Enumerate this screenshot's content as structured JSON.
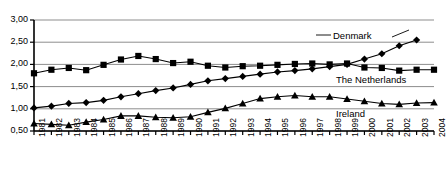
{
  "chart_data": {
    "type": "line",
    "title": "",
    "xlabel": "",
    "ylabel": "",
    "ylim": [
      0.5,
      3.0
    ],
    "yticks": [
      0.5,
      1.0,
      1.5,
      2.0,
      2.5,
      3.0
    ],
    "ytick_labels": [
      "0,50",
      "1,00",
      "1,50",
      "2,00",
      "2,50",
      "3,00"
    ],
    "grid": true,
    "legend": "inline-labels",
    "decimal_separator": ",",
    "x": [
      1981,
      1982,
      1983,
      1984,
      1985,
      1986,
      1987,
      1988,
      1989,
      1990,
      1991,
      1992,
      1993,
      1994,
      1995,
      1996,
      1997,
      1998,
      1999,
      2000,
      2001,
      2002,
      2003,
      2004
    ],
    "xtick_labels": [
      "1981",
      "1982",
      "1983",
      "1984",
      "1985",
      "1986",
      "1987",
      "1988",
      "1989",
      "1990",
      "1991",
      "1992",
      "1993",
      "1994",
      "1995",
      "1996",
      "1997",
      "1998",
      "1999",
      "2000",
      "2001",
      "2002",
      "2003",
      "2004"
    ],
    "series": [
      {
        "name": "Denmark",
        "marker": "diamond",
        "color": "#000000",
        "x": [
          1981,
          1982,
          1983,
          1984,
          1985,
          1986,
          1987,
          1988,
          1989,
          1990,
          1991,
          1992,
          1993,
          1994,
          1995,
          1996,
          1997,
          1998,
          1999,
          2000,
          2001,
          2002,
          2003
        ],
        "values": [
          1.02,
          1.06,
          1.12,
          1.14,
          1.19,
          1.27,
          1.34,
          1.41,
          1.47,
          1.55,
          1.63,
          1.68,
          1.73,
          1.78,
          1.83,
          1.86,
          1.9,
          1.95,
          2.0,
          2.12,
          2.24,
          2.42,
          2.55
        ]
      },
      {
        "name": "The Netherlands",
        "marker": "square",
        "color": "#000000",
        "x": [
          1981,
          1982,
          1983,
          1984,
          1985,
          1986,
          1987,
          1988,
          1989,
          1990,
          1991,
          1992,
          1993,
          1994,
          1995,
          1996,
          1997,
          1998,
          1999,
          2000,
          2001,
          2002,
          2003,
          2004
        ],
        "values": [
          1.8,
          1.88,
          1.92,
          1.87,
          1.99,
          2.11,
          2.19,
          2.12,
          2.03,
          2.06,
          1.97,
          1.93,
          1.96,
          1.97,
          1.99,
          2.01,
          2.02,
          2.0,
          2.02,
          1.93,
          1.92,
          1.86,
          1.88,
          1.88
        ]
      },
      {
        "name": "Ireland",
        "marker": "triangle",
        "color": "#000000",
        "x": [
          1981,
          1982,
          1983,
          1984,
          1985,
          1986,
          1987,
          1988,
          1989,
          1990,
          1991,
          1992,
          1993,
          1994,
          1995,
          1996,
          1997,
          1998,
          1999,
          2000,
          2001,
          2002,
          2003,
          2004
        ],
        "values": [
          0.67,
          0.65,
          0.63,
          0.7,
          0.76,
          0.84,
          0.84,
          0.81,
          0.8,
          0.82,
          0.92,
          1.01,
          1.12,
          1.23,
          1.27,
          1.3,
          1.27,
          1.27,
          1.22,
          1.17,
          1.12,
          1.1,
          1.13,
          1.14
        ]
      }
    ],
    "annotations": [
      {
        "text": "Denmark",
        "leader": true
      },
      {
        "text": "The Netherlands",
        "leader": false
      },
      {
        "text": "Ireland",
        "leader": false
      }
    ]
  }
}
